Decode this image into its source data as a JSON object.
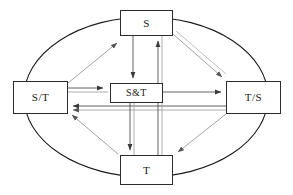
{
  "diagram": {
    "type": "node-link-diagram",
    "boundary": {
      "shape": "ellipse",
      "name": "system-boundary-ellipse",
      "cx": 146,
      "cy": 97,
      "rx": 122,
      "ry": 80,
      "stroke": "#1a1a1a"
    },
    "colors": {
      "box_border": "#2b2b2b",
      "box_fill": "#ffffff",
      "arrow_dark": "#3a3a3a",
      "arrow_light": "#9a9a9a",
      "background": "#ffffff"
    },
    "nodes": [
      {
        "id": "s",
        "label": "S",
        "position": "top"
      },
      {
        "id": "st",
        "label": "S/T",
        "position": "left"
      },
      {
        "id": "sandt",
        "label": "S&T",
        "position": "center"
      },
      {
        "id": "ts",
        "label": "T/S",
        "position": "right"
      },
      {
        "id": "t",
        "label": "T",
        "position": "bottom"
      }
    ],
    "edges": [
      {
        "from": "st",
        "to": "sandt",
        "style": "double-line",
        "arrow": "forward"
      },
      {
        "from": "sandt",
        "to": "ts",
        "style": "single-line",
        "arrow": "forward"
      },
      {
        "from": "ts",
        "to": "st",
        "style": "double-line",
        "arrow": "forward"
      },
      {
        "from": "s",
        "to": "sandt",
        "style": "single-line",
        "arrow": "forward"
      },
      {
        "from": "sandt",
        "to": "t",
        "style": "single-line",
        "arrow": "forward"
      },
      {
        "from": "t",
        "to": "s",
        "style": "double-line",
        "arrow": "forward"
      },
      {
        "from": "st",
        "to": "s",
        "style": "single-line",
        "arrow": "forward"
      },
      {
        "from": "s",
        "to": "ts",
        "style": "double-line",
        "arrow": "forward"
      },
      {
        "from": "ts",
        "to": "t",
        "style": "single-line",
        "arrow": "forward"
      },
      {
        "from": "t",
        "to": "st",
        "style": "single-line",
        "arrow": "forward"
      }
    ]
  }
}
